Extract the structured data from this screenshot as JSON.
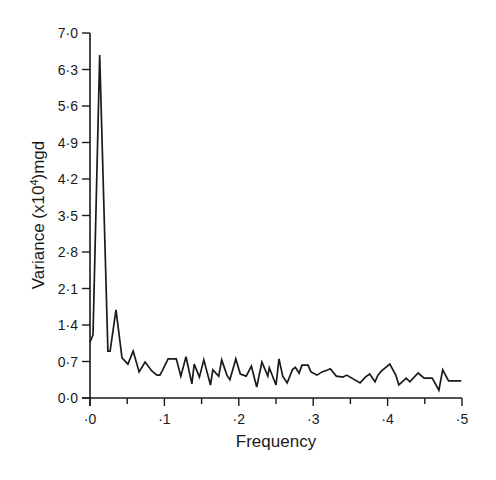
{
  "chart_data": {
    "type": "line",
    "title": "",
    "xlabel": "Frequency",
    "ylabel": "Variance (x10⁴)mgd",
    "ylabel_parts": {
      "pre": "Variance (x10",
      "sup": "4",
      "post": ")mgd"
    },
    "xlim": [
      0,
      0.5
    ],
    "ylim": [
      0,
      7.0
    ],
    "grid": false,
    "legend": null,
    "x_ticks": [
      0,
      0.1,
      0.2,
      0.3,
      0.4,
      0.5
    ],
    "x_minor_ticks": [
      0.05,
      0.15,
      0.25,
      0.35,
      0.45
    ],
    "x_tick_labels": [
      "·0",
      "·1",
      "·2",
      "·3",
      "·4",
      "·5"
    ],
    "y_ticks": [
      0.0,
      0.7,
      1.4,
      2.1,
      2.8,
      3.5,
      4.2,
      4.9,
      5.6,
      6.3,
      7.0
    ],
    "y_tick_labels": [
      "0·0",
      "0·7",
      "1·4",
      "2·1",
      "2·8",
      "3·5",
      "4·2",
      "4·9",
      "5·6",
      "6·3",
      "7·0"
    ],
    "series": [
      {
        "name": "Variance spectrum",
        "x": [
          0.0,
          0.004,
          0.013,
          0.024,
          0.027,
          0.035,
          0.043,
          0.051,
          0.058,
          0.066,
          0.074,
          0.083,
          0.09,
          0.094,
          0.097,
          0.105,
          0.116,
          0.122,
          0.129,
          0.137,
          0.14,
          0.147,
          0.153,
          0.162,
          0.165,
          0.173,
          0.177,
          0.184,
          0.188,
          0.196,
          0.202,
          0.21,
          0.217,
          0.224,
          0.231,
          0.239,
          0.241,
          0.25,
          0.254,
          0.259,
          0.265,
          0.272,
          0.276,
          0.281,
          0.285,
          0.293,
          0.297,
          0.305,
          0.312,
          0.32,
          0.323,
          0.331,
          0.34,
          0.345,
          0.363,
          0.37,
          0.376,
          0.383,
          0.387,
          0.392,
          0.403,
          0.411,
          0.415,
          0.425,
          0.43,
          0.441,
          0.449,
          0.46,
          0.469,
          0.474,
          0.482,
          0.491,
          0.499
        ],
        "values": [
          1.07,
          1.21,
          6.58,
          0.9,
          0.9,
          1.69,
          0.77,
          0.65,
          0.9,
          0.5,
          0.69,
          0.52,
          0.44,
          0.44,
          0.52,
          0.75,
          0.75,
          0.42,
          0.79,
          0.27,
          0.65,
          0.4,
          0.73,
          0.25,
          0.54,
          0.42,
          0.73,
          0.44,
          0.35,
          0.75,
          0.46,
          0.42,
          0.61,
          0.21,
          0.69,
          0.42,
          0.58,
          0.25,
          0.75,
          0.42,
          0.29,
          0.54,
          0.59,
          0.48,
          0.63,
          0.63,
          0.5,
          0.44,
          0.5,
          0.54,
          0.56,
          0.42,
          0.4,
          0.44,
          0.29,
          0.4,
          0.46,
          0.31,
          0.44,
          0.52,
          0.65,
          0.44,
          0.25,
          0.38,
          0.31,
          0.48,
          0.38,
          0.38,
          0.15,
          0.54,
          0.33,
          0.33,
          0.33
        ]
      }
    ]
  }
}
